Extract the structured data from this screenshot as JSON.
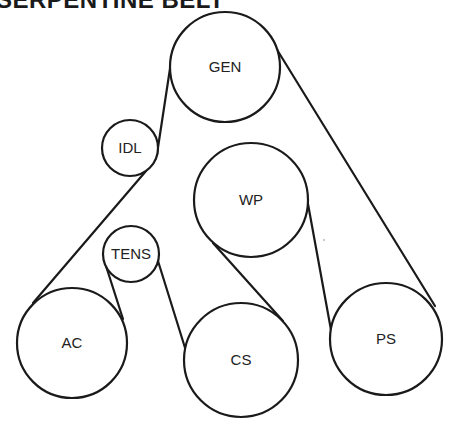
{
  "title": "SERPENTINE BELT",
  "colors": {
    "line": "#1a1a1a",
    "text": "#222222",
    "background": "#ffffff"
  },
  "pulleys": [
    {
      "id": "gen",
      "label": "GEN",
      "cx": 225,
      "cy": 67,
      "r": 55
    },
    {
      "id": "idl",
      "label": "IDL",
      "cx": 130,
      "cy": 148,
      "r": 28
    },
    {
      "id": "wp",
      "label": "WP",
      "cx": 251,
      "cy": 200,
      "r": 57
    },
    {
      "id": "tens",
      "label": "TENS",
      "cx": 131,
      "cy": 254,
      "r": 28
    },
    {
      "id": "ac",
      "label": "AC",
      "cx": 72,
      "cy": 343,
      "r": 55
    },
    {
      "id": "cs",
      "label": "CS",
      "cx": 241,
      "cy": 360,
      "r": 57
    },
    {
      "id": "ps",
      "label": "PS",
      "cx": 386,
      "cy": 339,
      "r": 56
    }
  ],
  "belt_segments": [
    {
      "from": "gen",
      "to": "idl",
      "x1": 171,
      "y1": 62,
      "x2": 157,
      "y2": 154
    },
    {
      "from": "idl",
      "to": "ac",
      "x1": 146,
      "y1": 171,
      "x2": 33,
      "y2": 303
    },
    {
      "from": "ac",
      "to": "tens",
      "x1": 123,
      "y1": 319,
      "x2": 106,
      "y2": 266
    },
    {
      "from": "tens",
      "to": "cs",
      "x1": 158,
      "y1": 261,
      "x2": 186,
      "y2": 351
    },
    {
      "from": "cs",
      "to": "wp",
      "x1": 283,
      "y1": 321,
      "x2": 213,
      "y2": 243
    },
    {
      "from": "wp",
      "to": "ps",
      "x1": 308,
      "y1": 204,
      "x2": 331,
      "y2": 330
    },
    {
      "from": "ps",
      "to": "gen",
      "x1": 435,
      "y1": 306,
      "x2": 276,
      "y2": 48
    }
  ]
}
